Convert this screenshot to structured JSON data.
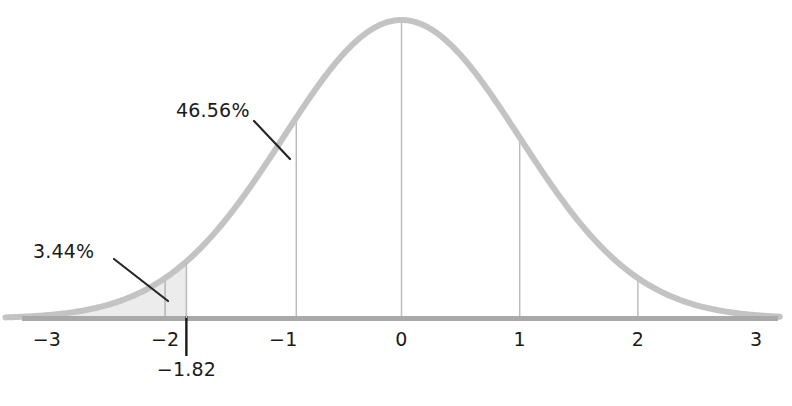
{
  "chart_data": {
    "type": "area",
    "title": "",
    "subtitle": "",
    "xlabel": "",
    "ylabel": "",
    "grid": false,
    "legend": null,
    "distribution": "standard-normal",
    "mean": 0,
    "sd": 1,
    "xlim": [
      -3.35,
      3.2
    ],
    "ylim": [
      0,
      0.42
    ],
    "x_tick_values": [
      -3,
      -2,
      -1,
      0,
      1,
      2,
      3
    ],
    "x_tick_labels": [
      "−3",
      "−2",
      "−1",
      "0",
      "1",
      "2",
      "3"
    ],
    "curve": {
      "color": "#c3c3c3",
      "width": 6,
      "formula": "phi(z) = exp(-z^2/2)/sqrt(2*pi)"
    },
    "axis": {
      "color": "#a9a9a9",
      "width": 5
    },
    "shaded_region": {
      "from": -3.35,
      "to": -1.82,
      "fill": "#ececec",
      "label": "3.44%",
      "area_percent": 3.44
    },
    "droplines": [
      {
        "z": -2,
        "kind": "short",
        "color": "#b4b4b4"
      },
      {
        "z": -0.89,
        "kind": "to-curve",
        "color": "#bdbdbd"
      },
      {
        "z": 0,
        "kind": "to-curve",
        "color": "#bdbdbd"
      },
      {
        "z": 1,
        "kind": "to-curve",
        "color": "#bdbdbd"
      },
      {
        "z": 2,
        "kind": "to-curve",
        "color": "#bdbdbd"
      }
    ],
    "markers": [
      {
        "z": -1.82,
        "label": "−1.82",
        "color": "#1a1a1a",
        "style": "vertical-tick-below-axis"
      }
    ],
    "annotations": [
      {
        "text": "3.44%",
        "value": 3.44,
        "units": "percent",
        "describes": "left-tail-area-below-z",
        "leader": true
      },
      {
        "text": "46.56%",
        "value": 46.56,
        "units": "percent",
        "describes": "area-between-z-and-mean",
        "leader": true
      }
    ]
  },
  "labels": {
    "tail_percent": "3.44%",
    "body_percent": "46.56%",
    "z_marker": "−1.82",
    "tick_neg3": "−3",
    "tick_neg2": "−2",
    "tick_neg1": "−1",
    "tick_0": "0",
    "tick_1": "1",
    "tick_2": "2",
    "tick_3": "3"
  },
  "colors": {
    "curve": "#c3c3c3",
    "axis": "#a9a9a9",
    "fill": "#ececec",
    "dropline": "#bdbdbd",
    "text": "#1a1a1a",
    "leader": "#262626",
    "background": "#ffffff"
  }
}
